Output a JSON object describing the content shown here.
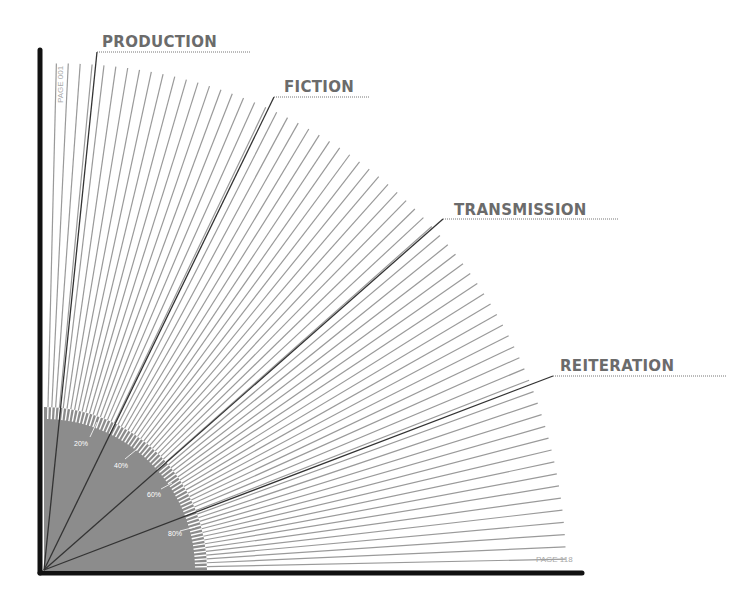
{
  "diagram": {
    "origin": {
      "x": 44,
      "y": 570
    },
    "ray_radius": 522,
    "ray_count": 66,
    "ray_angle_start_deg": 1.2,
    "ray_angle_end_deg": 88.6,
    "disc_radius": 163,
    "colors": {
      "axis": "#111111",
      "ray": "#9a9a9a",
      "highlight_ray": "#333333",
      "disc": "#8c8c8c",
      "label": "#6b6b6b",
      "page_label": "#a8a8a8",
      "percent_label": "#ffffff"
    }
  },
  "categories": [
    {
      "label": "PRODUCTION",
      "tip": {
        "x": 97,
        "y": 52
      },
      "text_x": 102,
      "text_y": 47,
      "underline_end": 251
    },
    {
      "label": "FICTION",
      "tip": {
        "x": 274,
        "y": 97
      },
      "text_x": 284,
      "text_y": 92,
      "underline_end": 370
    },
    {
      "label": "TRANSMISSION",
      "tip": {
        "x": 443,
        "y": 219
      },
      "text_x": 454,
      "text_y": 215,
      "underline_end": 619
    },
    {
      "label": "REITERATION",
      "tip": {
        "x": 553,
        "y": 376
      },
      "text_x": 560,
      "text_y": 371,
      "underline_end": 727
    }
  ],
  "percent_markers": [
    {
      "label": "20%",
      "x": 74,
      "y": 446,
      "tick": [
        90,
        437,
        97,
        422
      ]
    },
    {
      "label": "40%",
      "x": 114,
      "y": 468,
      "tick": [
        125,
        459,
        136,
        450
      ]
    },
    {
      "label": "60%",
      "x": 147,
      "y": 497,
      "tick": [
        161,
        489,
        172,
        483
      ]
    },
    {
      "label": "80%",
      "x": 168,
      "y": 536,
      "tick": [
        180,
        531,
        195,
        527
      ]
    }
  ],
  "page_labels": {
    "start": "PAGE 001",
    "end": "PAGE 118"
  }
}
